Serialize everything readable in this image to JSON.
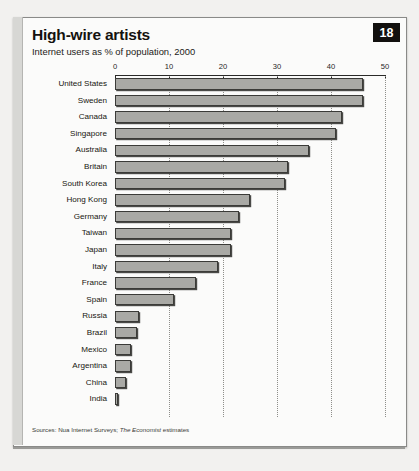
{
  "badge": {
    "number": "18"
  },
  "header": {
    "title": "High-wire artists",
    "subtitle": "Internet users as % of population, 2000"
  },
  "footer": {
    "source_prefix": "Sources: Nua Internet Surveys; ",
    "source_italic": "The Economist",
    "source_suffix": " estimates"
  },
  "chart_data": {
    "type": "bar",
    "orientation": "horizontal",
    "title": "High-wire artists",
    "subtitle": "Internet users as % of population, 2000",
    "xlabel": "",
    "ylabel": "",
    "xlim": [
      0,
      50
    ],
    "ticks": [
      0,
      10,
      20,
      30,
      40,
      50
    ],
    "tick_labels": [
      "0",
      "10",
      "20",
      "30",
      "40",
      "50"
    ],
    "grid": true,
    "legend": false,
    "bar_color": "#a9a9a5",
    "bar_edge_color": "#3b3b38",
    "categories": [
      "United States",
      "Sweden",
      "Canada",
      "Singapore",
      "Australia",
      "Britain",
      "South Korea",
      "Hong Kong",
      "Germany",
      "Taiwan",
      "Japan",
      "Italy",
      "France",
      "Spain",
      "Russia",
      "Brazil",
      "Mexico",
      "Argentina",
      "China",
      "India"
    ],
    "values": [
      46,
      46,
      42,
      41,
      36,
      32,
      31.5,
      25,
      23,
      21.5,
      21.5,
      19,
      15,
      11,
      4.5,
      4,
      3,
      3,
      2,
      0.5
    ],
    "source": "Sources: Nua Internet Surveys; The Economist estimates"
  }
}
